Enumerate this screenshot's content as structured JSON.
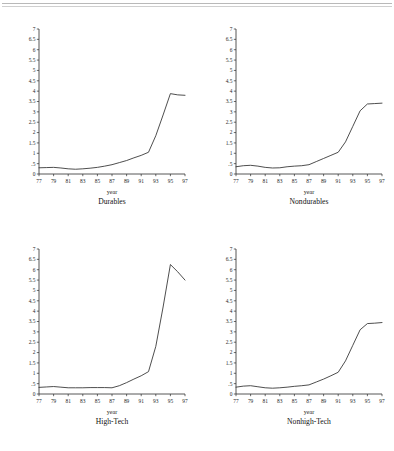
{
  "figure": {
    "top_rules": 2,
    "panel_count": 4,
    "line_color": "#2e2e2e",
    "axis_color": "#2b2b2b",
    "background": "#ffffff"
  },
  "chart_data": [
    {
      "type": "line",
      "title": "Durables",
      "xlabel": "year",
      "ylabel": "",
      "xlim": [
        77,
        97
      ],
      "ylim": [
        0,
        7
      ],
      "grid": false,
      "legend": "none",
      "xticks": [
        "77",
        "79",
        "81",
        "83",
        "85",
        "87",
        "89",
        "91",
        "93",
        "95",
        "97"
      ],
      "xtick_values": [
        77,
        79,
        81,
        83,
        85,
        87,
        89,
        91,
        93,
        95,
        97
      ],
      "yticks": [
        "0",
        ".5",
        "1",
        "1.5",
        "2",
        "2.5",
        "3",
        "3.5",
        "4",
        "4.5",
        "5",
        "5.5",
        "6",
        "6.5",
        "7"
      ],
      "ytick_values": [
        0,
        0.5,
        1,
        1.5,
        2,
        2.5,
        3,
        3.5,
        4,
        4.5,
        5,
        5.5,
        6,
        6.5,
        7
      ],
      "x": [
        77,
        78,
        79,
        80,
        81,
        82,
        83,
        84,
        85,
        86,
        87,
        88,
        89,
        90,
        91,
        92,
        93,
        94,
        95,
        96,
        97
      ],
      "values": [
        0.3,
        0.31,
        0.32,
        0.29,
        0.25,
        0.23,
        0.25,
        0.28,
        0.32,
        0.38,
        0.45,
        0.55,
        0.65,
        0.78,
        0.9,
        1.05,
        1.85,
        2.85,
        3.88,
        3.82,
        3.8
      ]
    },
    {
      "type": "line",
      "title": "Nondurables",
      "xlabel": "year",
      "ylabel": "",
      "xlim": [
        77,
        97
      ],
      "ylim": [
        0,
        7
      ],
      "grid": false,
      "legend": "none",
      "xticks": [
        "77",
        "79",
        "81",
        "83",
        "85",
        "87",
        "89",
        "91",
        "93",
        "95",
        "97"
      ],
      "xtick_values": [
        77,
        79,
        81,
        83,
        85,
        87,
        89,
        91,
        93,
        95,
        97
      ],
      "yticks": [
        "0",
        ".5",
        "1",
        "1.5",
        "2",
        "2.5",
        "3",
        "3.5",
        "4",
        "4.5",
        "5",
        "5.5",
        "6",
        "6.5",
        "7"
      ],
      "ytick_values": [
        0,
        0.5,
        1,
        1.5,
        2,
        2.5,
        3,
        3.5,
        4,
        4.5,
        5,
        5.5,
        6,
        6.5,
        7
      ],
      "x": [
        77,
        78,
        79,
        80,
        81,
        82,
        83,
        84,
        85,
        86,
        87,
        88,
        89,
        90,
        91,
        92,
        93,
        94,
        95,
        96,
        97
      ],
      "values": [
        0.35,
        0.4,
        0.42,
        0.38,
        0.32,
        0.29,
        0.3,
        0.35,
        0.38,
        0.4,
        0.45,
        0.6,
        0.75,
        0.9,
        1.05,
        1.55,
        2.3,
        3.05,
        3.38,
        3.4,
        3.42
      ]
    },
    {
      "type": "line",
      "title": "High-Tech",
      "xlabel": "year",
      "ylabel": "",
      "xlim": [
        77,
        97
      ],
      "ylim": [
        0,
        7
      ],
      "grid": false,
      "legend": "none",
      "xticks": [
        "77",
        "79",
        "81",
        "83",
        "85",
        "87",
        "89",
        "91",
        "93",
        "95",
        "97"
      ],
      "xtick_values": [
        77,
        79,
        81,
        83,
        85,
        87,
        89,
        91,
        93,
        95,
        97
      ],
      "yticks": [
        "0",
        ".5",
        "1",
        "1.5",
        "2",
        "2.5",
        "3",
        "3.5",
        "4",
        "4.5",
        "5",
        "5.5",
        "6",
        "6.5",
        "7"
      ],
      "ytick_values": [
        0,
        0.5,
        1,
        1.5,
        2,
        2.5,
        3,
        3.5,
        4,
        4.5,
        5,
        5.5,
        6,
        6.5,
        7
      ],
      "x": [
        77,
        78,
        79,
        80,
        81,
        82,
        83,
        84,
        85,
        86,
        87,
        88,
        89,
        90,
        91,
        92,
        93,
        94,
        95,
        96,
        97
      ],
      "values": [
        0.32,
        0.34,
        0.36,
        0.33,
        0.3,
        0.3,
        0.3,
        0.31,
        0.31,
        0.31,
        0.3,
        0.4,
        0.55,
        0.72,
        0.88,
        1.08,
        2.3,
        4.2,
        6.25,
        5.9,
        5.5
      ]
    },
    {
      "type": "line",
      "title": "Nonhigh-Tech",
      "xlabel": "year",
      "ylabel": "",
      "xlim": [
        77,
        97
      ],
      "ylim": [
        0,
        7
      ],
      "grid": false,
      "legend": "none",
      "xticks": [
        "77",
        "79",
        "81",
        "83",
        "85",
        "87",
        "89",
        "91",
        "93",
        "95",
        "97"
      ],
      "xtick_values": [
        77,
        79,
        81,
        83,
        85,
        87,
        89,
        91,
        93,
        95,
        97
      ],
      "yticks": [
        "0",
        ".5",
        "1",
        "1.5",
        "2",
        "2.5",
        "3",
        "3.5",
        "4",
        "4.5",
        "5",
        "5.5",
        "6",
        "6.5",
        "7"
      ],
      "ytick_values": [
        0,
        0.5,
        1,
        1.5,
        2,
        2.5,
        3,
        3.5,
        4,
        4.5,
        5,
        5.5,
        6,
        6.5,
        7
      ],
      "x": [
        77,
        78,
        79,
        80,
        81,
        82,
        83,
        84,
        85,
        86,
        87,
        88,
        89,
        90,
        91,
        92,
        93,
        94,
        95,
        96,
        97
      ],
      "values": [
        0.33,
        0.38,
        0.4,
        0.35,
        0.3,
        0.28,
        0.3,
        0.33,
        0.37,
        0.4,
        0.44,
        0.58,
        0.72,
        0.88,
        1.05,
        1.6,
        2.35,
        3.1,
        3.4,
        3.42,
        3.45
      ]
    }
  ]
}
